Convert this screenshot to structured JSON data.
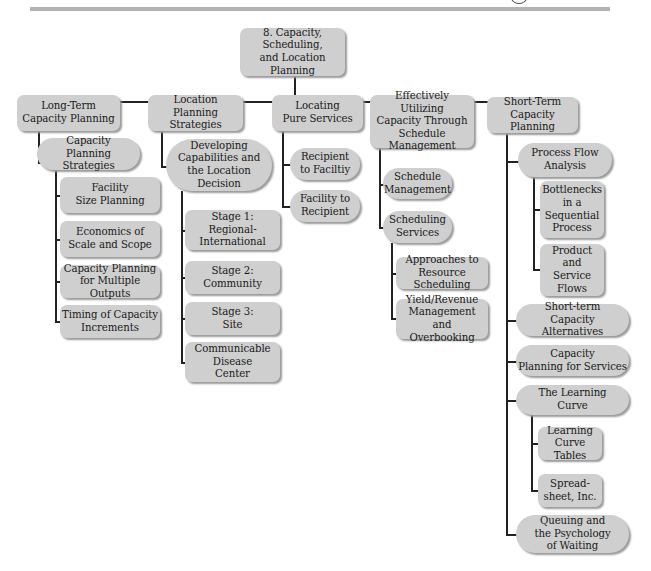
{
  "header": {
    "rule_color": "#b3b3b3"
  },
  "colors": {
    "node_fill": "#cfcfcf",
    "node_shadow": "#9a9a9a",
    "connector": "#222222",
    "text": "#1a1a1a"
  },
  "root": {
    "label": "8. Capacity, Scheduling,\nand Location\nPlanning"
  },
  "branches": [
    {
      "label": "Long-Term\nCapacity Planning",
      "children": [
        {
          "label": "Capacity\nPlanning Strategies",
          "children": [
            {
              "label": "Facility\nSize Planning"
            },
            {
              "label": "Economics of\nScale and Scope"
            },
            {
              "label": "Capacity Planning\nfor Multiple Outputs"
            },
            {
              "label": "Timing of Capacity\nIncrements"
            }
          ]
        }
      ]
    },
    {
      "label": "Location Planning\nStrategies",
      "children": [
        {
          "label": "Developing\nCapabilities and\nthe Location\nDecision",
          "children": [
            {
              "label": "Stage 1:\nRegional-\nInternational"
            },
            {
              "label": "Stage 2:\nCommunity"
            },
            {
              "label": "Stage 3:\nSite"
            },
            {
              "label": "Communicable\nDisease\nCenter"
            }
          ]
        }
      ]
    },
    {
      "label": "Locating\nPure Services",
      "children": [
        {
          "label": "Recipient\nto Faciltiy"
        },
        {
          "label": "Facility to\nRecipient"
        }
      ]
    },
    {
      "label": "Effectively Utilizing\nCapacity Through\nSchedule Management",
      "children": [
        {
          "label": "Schedule\nManagement"
        },
        {
          "label": "Scheduling\nServices",
          "children": [
            {
              "label": "Approaches to\nResource Scheduling"
            },
            {
              "label": "Yield/Revenue\nManagement and\nOverbooking"
            }
          ]
        }
      ]
    },
    {
      "label": "Short-Term\nCapacity Planning",
      "children": [
        {
          "label": "Process Flow\nAnalysis",
          "children": [
            {
              "label": "Bottlenecks\nin a\nSequential\nProcess"
            },
            {
              "label": "Product and\nService\nFlows"
            }
          ]
        },
        {
          "label": "Short-term\nCapacity Alternatives"
        },
        {
          "label": "Capacity\nPlanning for Services"
        },
        {
          "label": "The Learning\nCurve",
          "children": [
            {
              "label": "Learning\nCurve Tables"
            },
            {
              "label": "Spread-\nsheet, Inc."
            }
          ]
        },
        {
          "label": "Queuing and\nthe Psychology\nof Waiting"
        }
      ]
    }
  ]
}
